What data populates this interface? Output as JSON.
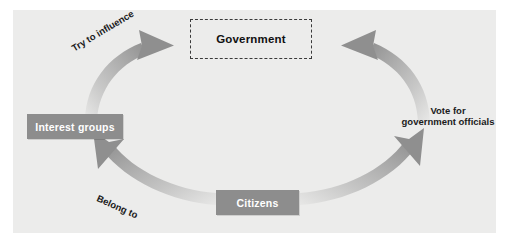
{
  "diagram": {
    "panel_color": "#ececeb",
    "arrow_color": "#9a9a9a",
    "node_fill": "#8d8d8d",
    "node_text_color": "#ffffff",
    "nodes": {
      "government": {
        "label": "Government",
        "style": "dashed-outline"
      },
      "interest_groups": {
        "label": "Interest groups",
        "style": "filled-gray"
      },
      "citizens": {
        "label": "Citizens",
        "style": "filled-gray"
      }
    },
    "edges": {
      "interest_to_government": {
        "label": "Try to influence",
        "from": "Interest groups",
        "to": "Government"
      },
      "citizens_to_government": {
        "label_line1": "Vote for",
        "label_line2": "government officials",
        "from": "Citizens",
        "to": "Government"
      },
      "citizens_to_interest": {
        "label": "Belong to",
        "from": "Citizens",
        "to": "Interest groups"
      }
    }
  }
}
